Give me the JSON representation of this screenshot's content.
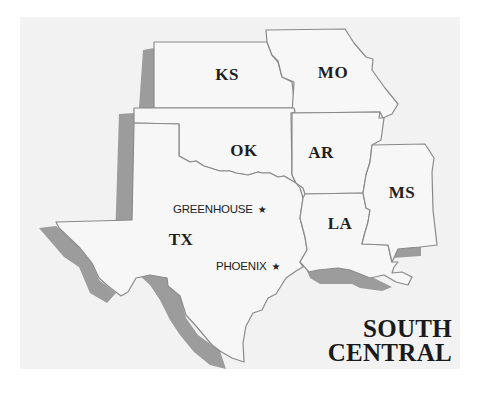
{
  "map": {
    "panel_color": "#f2f2f2",
    "state_fill": "#f7f7f7",
    "border_color": "#8a8a8a",
    "shadow_color": "#9c9c9c",
    "title_lines": [
      "SOUTH",
      "CENTRAL"
    ],
    "states": [
      {
        "abbr": "KS",
        "x": 227,
        "y": 75
      },
      {
        "abbr": "MO",
        "x": 333,
        "y": 73
      },
      {
        "abbr": "OK",
        "x": 244,
        "y": 151
      },
      {
        "abbr": "AR",
        "x": 321,
        "y": 153
      },
      {
        "abbr": "MS",
        "x": 402,
        "y": 193
      },
      {
        "abbr": "LA",
        "x": 340,
        "y": 224
      },
      {
        "abbr": "TX",
        "x": 181,
        "y": 240
      }
    ],
    "cities": [
      {
        "name": "GREENHOUSE",
        "marker": "★",
        "x": 173,
        "y": 203
      },
      {
        "name": "PHOENIX",
        "marker": "★",
        "x": 216,
        "y": 260
      }
    ]
  }
}
